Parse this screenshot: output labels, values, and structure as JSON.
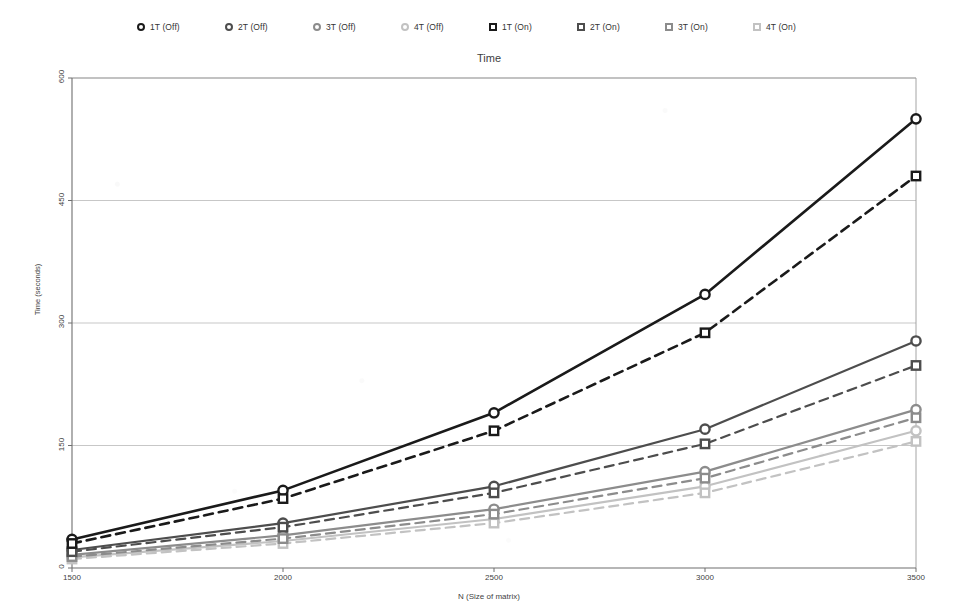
{
  "chart_data": {
    "type": "line",
    "title": "Time",
    "xlabel": "N (Size of matrix)",
    "ylabel": "Time (seconds)",
    "x": [
      1500,
      2000,
      2500,
      3000,
      3500
    ],
    "xtick_labels": [
      "1500",
      "2000",
      "2500",
      "3000",
      "3500"
    ],
    "ytick_labels": [
      "0",
      "150",
      "300",
      "450",
      "600"
    ],
    "yticks": [
      0,
      150,
      300,
      450,
      600
    ],
    "xlim": [
      1500,
      3500
    ],
    "ylim": [
      0,
      600
    ],
    "grid": "horizontal",
    "legend_position": "top",
    "series": [
      {
        "name": "1T (Off)",
        "marker": "circle",
        "line": "solid",
        "color": "#1a1a1a",
        "values": [
          35,
          95,
          190,
          335,
          550
        ]
      },
      {
        "name": "2T (Off)",
        "marker": "circle",
        "line": "solid",
        "color": "#4d4d4d",
        "values": [
          22,
          55,
          100,
          170,
          278
        ]
      },
      {
        "name": "3T (Off)",
        "marker": "circle",
        "line": "solid",
        "color": "#8c8c8c",
        "values": [
          16,
          40,
          72,
          118,
          194
        ]
      },
      {
        "name": "4T (Off)",
        "marker": "circle",
        "line": "solid",
        "color": "#c2c2c2",
        "values": [
          13,
          33,
          60,
          100,
          168
        ]
      },
      {
        "name": "1T (On)",
        "marker": "square",
        "line": "dashed",
        "color": "#1a1a1a",
        "values": [
          30,
          85,
          168,
          288,
          480
        ]
      },
      {
        "name": "2T (On)",
        "marker": "square",
        "line": "dashed",
        "color": "#4d4d4d",
        "values": [
          20,
          50,
          92,
          152,
          248
        ]
      },
      {
        "name": "3T (On)",
        "marker": "square",
        "line": "dashed",
        "color": "#8c8c8c",
        "values": [
          14,
          36,
          66,
          110,
          184
        ]
      },
      {
        "name": "4T (On)",
        "marker": "square",
        "line": "dashed",
        "color": "#c2c2c2",
        "values": [
          11,
          30,
          55,
          92,
          155
        ]
      }
    ]
  }
}
